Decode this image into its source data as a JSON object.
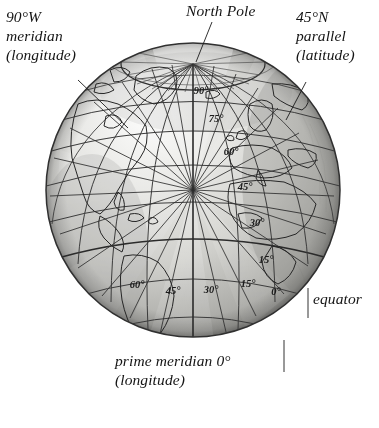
{
  "figure": {
    "background_color": "#ffffff",
    "ink_color": "#1b1b1b"
  },
  "globe": {
    "center_x": 193,
    "center_y": 190,
    "radius": 147,
    "north_pole_x": 193,
    "north_pole_y": 64,
    "fill_light": "#f4f4f2",
    "fill_mid": "#c9c9c6",
    "fill_dark": "#9a9a97",
    "graticule_color": "#3a3a3a",
    "coastline_color": "#2a2a2a"
  },
  "annotations": {
    "meridian_west": {
      "line1": "90°W",
      "line2": "meridian",
      "line3": "(longitude)"
    },
    "north_pole": {
      "line1": "North Pole"
    },
    "parallel_north": {
      "line1": "45°N",
      "line2": "parallel",
      "line3": "(latitude)"
    },
    "equator": {
      "line1": "equator"
    },
    "prime_meridian": {
      "line1": "prime meridian 0°",
      "line2": "(longitude)"
    }
  },
  "latitude_labels": [
    {
      "text": "90°",
      "x": 201,
      "y": 94
    },
    {
      "text": "75°",
      "x": 216,
      "y": 122
    },
    {
      "text": "60°",
      "x": 231,
      "y": 155
    },
    {
      "text": "45°",
      "x": 245,
      "y": 190
    },
    {
      "text": "30°",
      "x": 257,
      "y": 226
    },
    {
      "text": "15°",
      "x": 266,
      "y": 263
    }
  ],
  "longitude_labels": [
    {
      "text": "60°",
      "x": 137,
      "y": 288
    },
    {
      "text": "45°",
      "x": 173,
      "y": 294
    },
    {
      "text": "30°",
      "x": 211,
      "y": 293
    },
    {
      "text": "15°",
      "x": 248,
      "y": 287
    },
    {
      "text": "0°",
      "x": 276,
      "y": 295
    }
  ],
  "chart_data": {
    "type": "map",
    "projection": "orthographic-globe",
    "center_longitude_deg": -20,
    "center_latitude_deg": 30,
    "graticule": {
      "parallel_spacing_deg": 15,
      "meridian_spacing_deg": 15,
      "parallels_labeled_deg": [
        90,
        75,
        60,
        45,
        30,
        15
      ],
      "meridians_labeled_deg": [
        60,
        45,
        30,
        15,
        0
      ]
    },
    "callouts": [
      {
        "label": "90°W meridian (longitude)",
        "kind": "meridian",
        "value_deg": -90
      },
      {
        "label": "North Pole",
        "kind": "pole",
        "value_deg": 90
      },
      {
        "label": "45°N parallel (latitude)",
        "kind": "parallel",
        "value_deg": 45
      },
      {
        "label": "equator",
        "kind": "parallel",
        "value_deg": 0
      },
      {
        "label": "prime meridian 0° (longitude)",
        "kind": "meridian",
        "value_deg": 0
      }
    ]
  }
}
